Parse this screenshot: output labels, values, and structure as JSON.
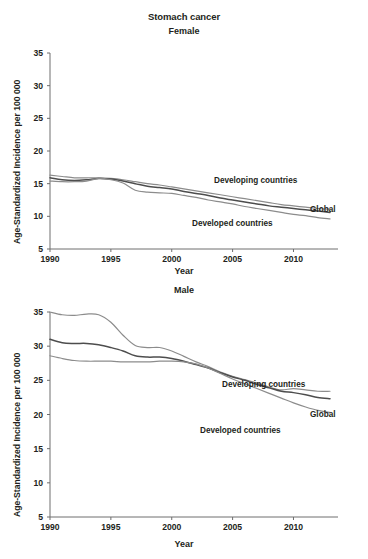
{
  "figure": {
    "title": "Stomach cancer",
    "xlabel": "Year",
    "ylabel": "Age-Standardized Incidence per 100 000"
  },
  "chart_data": [
    {
      "type": "line",
      "title": "Female",
      "xlabel": "Year",
      "ylabel": "Age-Standardized Incidence per 100 000",
      "xlim": [
        1990,
        2013
      ],
      "ylim": [
        5,
        35
      ],
      "xticks": [
        1990,
        1995,
        2000,
        2005,
        2010
      ],
      "yticks": [
        5,
        10,
        15,
        20,
        25,
        30,
        35
      ],
      "grid": false,
      "legend_position": "inline-right",
      "x": [
        1990,
        1991,
        1992,
        1993,
        1994,
        1995,
        1996,
        1997,
        1998,
        1999,
        2000,
        2001,
        2002,
        2003,
        2004,
        2005,
        2006,
        2007,
        2008,
        2009,
        2010,
        2011,
        2012,
        2013
      ],
      "series": [
        {
          "name": "Developing countries",
          "color": "#8c8c8c",
          "values": [
            16.3,
            16.1,
            15.9,
            15.9,
            15.9,
            15.8,
            15.6,
            15.3,
            15.0,
            14.8,
            14.5,
            14.2,
            13.9,
            13.6,
            13.3,
            13.0,
            12.7,
            12.4,
            12.1,
            11.8,
            11.6,
            11.4,
            11.2,
            11.1
          ]
        },
        {
          "name": "Global",
          "color": "#4d4d4d",
          "values": [
            15.9,
            15.6,
            15.5,
            15.6,
            15.8,
            15.7,
            15.4,
            15.0,
            14.6,
            14.4,
            14.2,
            13.8,
            13.5,
            13.2,
            12.8,
            12.5,
            12.2,
            11.9,
            11.6,
            11.4,
            11.2,
            11.0,
            10.8,
            10.6
          ]
        },
        {
          "name": "Developed countries",
          "color": "#8c8c8c",
          "values": [
            15.4,
            15.3,
            15.3,
            15.4,
            15.8,
            15.6,
            15.1,
            14.0,
            13.7,
            13.6,
            13.5,
            13.2,
            12.9,
            12.5,
            12.2,
            11.9,
            11.5,
            11.2,
            10.9,
            10.6,
            10.3,
            10.1,
            9.8,
            9.6
          ]
        }
      ]
    },
    {
      "type": "line",
      "title": "Male",
      "xlabel": "Year",
      "ylabel": "Age-Standardized Incidence per 100 000",
      "xlim": [
        1990,
        2013
      ],
      "ylim": [
        5,
        35
      ],
      "xticks": [
        1990,
        1995,
        2000,
        2005,
        2010
      ],
      "yticks": [
        5,
        10,
        15,
        20,
        25,
        30,
        35
      ],
      "grid": false,
      "legend_position": "inline-right",
      "x": [
        1990,
        1991,
        1992,
        1993,
        1994,
        1995,
        1996,
        1997,
        1998,
        1999,
        2000,
        2001,
        2002,
        2003,
        2004,
        2005,
        2006,
        2007,
        2008,
        2009,
        2010,
        2011,
        2012,
        2013
      ],
      "series": [
        {
          "name": "Developing countries",
          "color": "#8c8c8c",
          "values": [
            35.0,
            34.6,
            34.5,
            34.7,
            34.6,
            33.5,
            31.6,
            30.1,
            29.8,
            29.8,
            29.3,
            28.5,
            27.7,
            27.0,
            26.2,
            25.6,
            25.1,
            24.6,
            24.0,
            23.6,
            23.8,
            23.6,
            23.4,
            23.4
          ]
        },
        {
          "name": "Global",
          "color": "#4d4d4d",
          "values": [
            31.0,
            30.5,
            30.4,
            30.4,
            30.2,
            29.8,
            29.3,
            28.6,
            28.4,
            28.4,
            28.2,
            27.8,
            27.3,
            26.8,
            26.1,
            25.5,
            25.0,
            24.4,
            23.9,
            23.4,
            23.2,
            22.9,
            22.5,
            22.3
          ]
        },
        {
          "name": "Developed countries",
          "color": "#8c8c8c",
          "values": [
            28.6,
            28.2,
            27.9,
            27.8,
            27.8,
            27.8,
            27.7,
            27.7,
            27.7,
            27.8,
            27.8,
            27.7,
            27.4,
            26.8,
            26.0,
            25.2,
            24.5,
            23.8,
            23.1,
            22.4,
            21.7,
            21.1,
            20.6,
            20.3
          ]
        }
      ]
    }
  ]
}
